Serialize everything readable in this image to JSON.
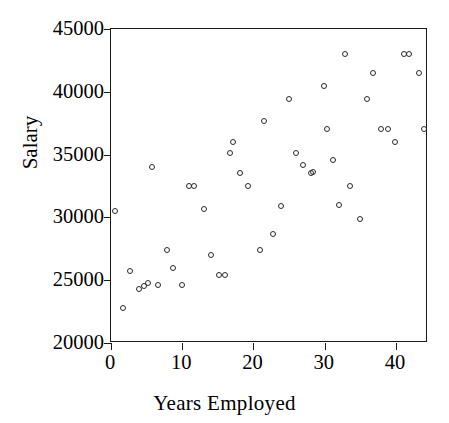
{
  "chart_data": {
    "type": "scatter",
    "title": "",
    "xlabel": "Years Employed",
    "ylabel": "Salary",
    "xlim": [
      0,
      44.5
    ],
    "ylim": [
      20000,
      45000
    ],
    "xticks": [
      0,
      10,
      20,
      30,
      40
    ],
    "xtick_labels": [
      "0",
      "10",
      "20",
      "30",
      "40"
    ],
    "yticks": [
      20000,
      25000,
      30000,
      35000,
      40000,
      45000
    ],
    "ytick_labels": [
      "20000",
      "25000",
      "30000",
      "35000",
      "40000",
      "45000"
    ],
    "grid": false,
    "legend": null,
    "marker": "open-circle",
    "marker_color": "#2b2b2b",
    "points": [
      {
        "x": 0.5,
        "y": 30500
      },
      {
        "x": 1.7,
        "y": 22800
      },
      {
        "x": 2.6,
        "y": 25700
      },
      {
        "x": 3.9,
        "y": 24300
      },
      {
        "x": 4.7,
        "y": 24500
      },
      {
        "x": 5.2,
        "y": 24800
      },
      {
        "x": 5.7,
        "y": 34000
      },
      {
        "x": 6.6,
        "y": 24600
      },
      {
        "x": 7.8,
        "y": 27400
      },
      {
        "x": 8.7,
        "y": 26000
      },
      {
        "x": 9.9,
        "y": 24600
      },
      {
        "x": 10.9,
        "y": 32500
      },
      {
        "x": 11.7,
        "y": 32500
      },
      {
        "x": 13.0,
        "y": 30700
      },
      {
        "x": 14.0,
        "y": 27000
      },
      {
        "x": 15.2,
        "y": 25400
      },
      {
        "x": 16.0,
        "y": 25400
      },
      {
        "x": 16.7,
        "y": 35100
      },
      {
        "x": 17.1,
        "y": 36000
      },
      {
        "x": 18.1,
        "y": 33500
      },
      {
        "x": 19.2,
        "y": 32500
      },
      {
        "x": 20.9,
        "y": 27400
      },
      {
        "x": 21.5,
        "y": 37700
      },
      {
        "x": 22.8,
        "y": 28700
      },
      {
        "x": 23.9,
        "y": 30900
      },
      {
        "x": 25.0,
        "y": 39400
      },
      {
        "x": 25.9,
        "y": 35100
      },
      {
        "x": 26.9,
        "y": 34200
      },
      {
        "x": 28.1,
        "y": 33500
      },
      {
        "x": 28.4,
        "y": 33600
      },
      {
        "x": 29.9,
        "y": 40500
      },
      {
        "x": 30.3,
        "y": 37000
      },
      {
        "x": 31.2,
        "y": 34600
      },
      {
        "x": 32.0,
        "y": 31000
      },
      {
        "x": 32.9,
        "y": 43000
      },
      {
        "x": 33.5,
        "y": 32500
      },
      {
        "x": 35.0,
        "y": 29900
      },
      {
        "x": 36.0,
        "y": 39400
      },
      {
        "x": 36.8,
        "y": 41500
      },
      {
        "x": 37.9,
        "y": 37000
      },
      {
        "x": 38.9,
        "y": 37000
      },
      {
        "x": 39.8,
        "y": 36000
      },
      {
        "x": 41.1,
        "y": 43000
      },
      {
        "x": 41.9,
        "y": 43000
      },
      {
        "x": 43.2,
        "y": 41500
      },
      {
        "x": 44.0,
        "y": 37000
      }
    ]
  }
}
